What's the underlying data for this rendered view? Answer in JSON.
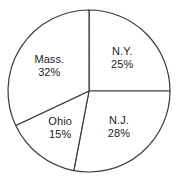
{
  "chart_data": {
    "type": "pie",
    "title": "",
    "subtitle": "",
    "xlabel": "",
    "ylabel": "",
    "legend_position": "none",
    "grid": false,
    "start_angle_deg": 0,
    "direction": "clockwise",
    "units": "percent",
    "categories": [
      "N.Y.",
      "N.J.",
      "Ohio",
      "Mass."
    ],
    "values": [
      25,
      28,
      15,
      32
    ],
    "labels": [
      "25%",
      "28%",
      "15%",
      "32%"
    ],
    "slices": [
      {
        "name": "N.Y.",
        "value": 25,
        "label": "25%",
        "start_deg": 0,
        "end_deg": 90,
        "fill": "#ffffff",
        "stroke": "#3a3a3a"
      },
      {
        "name": "N.J.",
        "value": 28,
        "label": "28%",
        "start_deg": 90,
        "end_deg": 190.8,
        "fill": "#ffffff",
        "stroke": "#3a3a3a"
      },
      {
        "name": "Ohio",
        "value": 15,
        "label": "15%",
        "start_deg": 190.8,
        "end_deg": 244.8,
        "fill": "#ffffff",
        "stroke": "#3a3a3a"
      },
      {
        "name": "Mass.",
        "value": 32,
        "label": "32%",
        "start_deg": 244.8,
        "end_deg": 360,
        "fill": "#ffffff",
        "stroke": "#3a3a3a"
      }
    ],
    "geometry": {
      "center_x": 89,
      "center_y": 91,
      "radius": 81,
      "label_radius": 47
    },
    "style": {
      "background": "#ffffff",
      "outline_color": "#3a3a3a",
      "text_color": "#1c1c1c",
      "stroke_width": 1.2
    }
  }
}
